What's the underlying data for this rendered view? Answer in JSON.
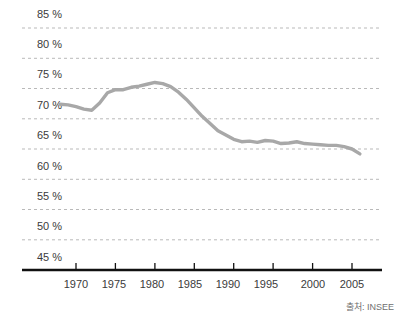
{
  "chart_data": {
    "type": "line",
    "title": "",
    "xlabel": "",
    "ylabel": "",
    "xlim": [
      1968,
      2007
    ],
    "ylim": [
      45,
      85
    ],
    "grid": true,
    "legend": null,
    "y_tick_labels": [
      "85 %",
      "80 %",
      "75 %",
      "70 %",
      "65 %",
      "60 %",
      "55 %",
      "50 %",
      "45 %"
    ],
    "y_ticks": [
      85,
      80,
      75,
      70,
      65,
      60,
      55,
      50,
      45
    ],
    "x_tick_labels": [
      "1970",
      "1975",
      "1980",
      "1985",
      "1990",
      "1995",
      "2000",
      "2005"
    ],
    "x_ticks": [
      1970,
      1975,
      1980,
      1985,
      1990,
      1995,
      2000,
      2005
    ],
    "series": [
      {
        "name": "rate",
        "color": "#a8a8a8",
        "x": [
          1968,
          1969,
          1970,
          1971,
          1972,
          1973,
          1974,
          1975,
          1976,
          1977,
          1978,
          1979,
          1980,
          1981,
          1982,
          1983,
          1984,
          1985,
          1986,
          1987,
          1988,
          1989,
          1990,
          1991,
          1992,
          1993,
          1994,
          1995,
          1996,
          1997,
          1998,
          1999,
          2000,
          2001,
          2002,
          2003,
          2004,
          2005,
          2006
        ],
        "values": [
          72.4,
          72.3,
          72.0,
          71.6,
          71.4,
          72.6,
          74.3,
          74.8,
          74.8,
          75.2,
          75.4,
          75.7,
          76.0,
          75.8,
          75.3,
          74.4,
          73.2,
          71.8,
          70.4,
          69.2,
          68.0,
          67.3,
          66.6,
          66.2,
          66.3,
          66.1,
          66.4,
          66.3,
          65.9,
          66.0,
          66.2,
          65.9,
          65.8,
          65.7,
          65.6,
          65.6,
          65.4,
          65.0,
          64.2
        ]
      }
    ],
    "source": "출처: INSEE",
    "colors": {
      "line": "#a8a8a8",
      "grid": "#b9b9b9",
      "axis": "#000000",
      "text": "#3b3b3b",
      "source_text": "#6f6f6f"
    }
  }
}
